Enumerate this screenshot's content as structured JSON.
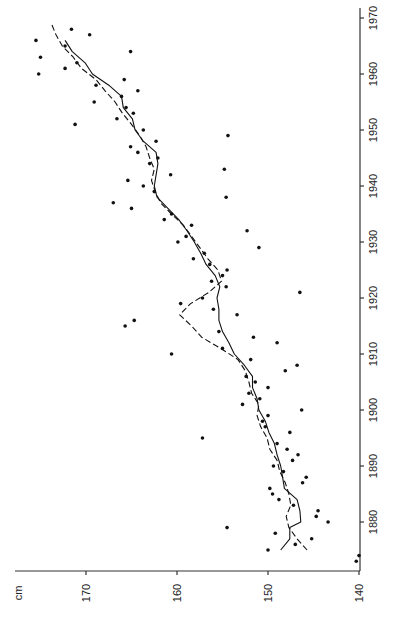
{
  "chart_data": {
    "type": "scatter",
    "title": "",
    "orientation": "rotated 90° (height axis horizontal at bottom, year axis vertical at right)",
    "xlabel": "Year",
    "ylabel": "cm",
    "height_axis": {
      "label": "cm",
      "ticks": [
        170,
        160,
        150,
        140
      ],
      "range": [
        140,
        176
      ]
    },
    "year_axis": {
      "ticks": [
        1880,
        1890,
        1900,
        1910,
        1920,
        1930,
        1940,
        1950,
        1960,
        1970
      ],
      "range": [
        1871,
        1970
      ]
    },
    "grid": false,
    "legend": null,
    "series": [
      {
        "name": "observations",
        "style": "points",
        "points": [
          [
            1873,
            140.3
          ],
          [
            1874,
            140.0
          ],
          [
            1875,
            150.0
          ],
          [
            1876,
            147.0
          ],
          [
            1877,
            145.2
          ],
          [
            1878,
            149.2
          ],
          [
            1879,
            154.5
          ],
          [
            1880,
            143.4
          ],
          [
            1881,
            144.7
          ],
          [
            1882,
            144.5
          ],
          [
            1883,
            147.2
          ],
          [
            1884,
            148.8
          ],
          [
            1885,
            149.5
          ],
          [
            1886,
            149.8
          ],
          [
            1887,
            146.2
          ],
          [
            1888,
            145.8
          ],
          [
            1889,
            148.3
          ],
          [
            1890,
            149.4
          ],
          [
            1891,
            147.3
          ],
          [
            1892,
            146.7
          ],
          [
            1893,
            147.9
          ],
          [
            1894,
            149.0
          ],
          [
            1895,
            157.2
          ],
          [
            1896,
            147.6
          ],
          [
            1897,
            150.3
          ],
          [
            1898,
            150.6
          ],
          [
            1899,
            150.0
          ],
          [
            1900,
            146.3
          ],
          [
            1901,
            152.8
          ],
          [
            1902,
            150.9
          ],
          [
            1903,
            152.1
          ],
          [
            1904,
            150.0
          ],
          [
            1905,
            151.4
          ],
          [
            1906,
            152.4
          ],
          [
            1907,
            148.1
          ],
          [
            1908,
            146.8
          ],
          [
            1909,
            151.9
          ],
          [
            1910,
            160.6
          ],
          [
            1911,
            155.0
          ],
          [
            1912,
            149.0
          ],
          [
            1913,
            151.6
          ],
          [
            1914,
            155.4
          ],
          [
            1915,
            165.7
          ],
          [
            1916,
            164.7
          ],
          [
            1917,
            153.4
          ],
          [
            1918,
            156.0
          ],
          [
            1919,
            159.6
          ],
          [
            1920,
            157.2
          ],
          [
            1921,
            146.5
          ],
          [
            1922,
            154.6
          ],
          [
            1923,
            156.2
          ],
          [
            1924,
            155.0
          ],
          [
            1925,
            154.5
          ],
          [
            1926,
            156.4
          ],
          [
            1927,
            158.2
          ],
          [
            1928,
            157.0
          ],
          [
            1929,
            151.0
          ],
          [
            1930,
            159.9
          ],
          [
            1931,
            159.0
          ],
          [
            1932,
            152.3
          ],
          [
            1933,
            158.4
          ],
          [
            1934,
            161.4
          ],
          [
            1935,
            160.6
          ],
          [
            1936,
            165.0
          ],
          [
            1937,
            167.0
          ],
          [
            1938,
            154.6
          ],
          [
            1939,
            162.5
          ],
          [
            1940,
            163.7
          ],
          [
            1941,
            165.4
          ],
          [
            1942,
            160.7
          ],
          [
            1943,
            154.8
          ],
          [
            1944,
            163.0
          ],
          [
            1945,
            162.1
          ],
          [
            1946,
            164.3
          ],
          [
            1947,
            165.1
          ],
          [
            1948,
            162.3
          ],
          [
            1949,
            154.4
          ],
          [
            1950,
            163.7
          ],
          [
            1951,
            171.2
          ],
          [
            1952,
            166.6
          ],
          [
            1953,
            164.8
          ],
          [
            1954,
            165.6
          ],
          [
            1955,
            169.1
          ],
          [
            1956,
            166.1
          ],
          [
            1957,
            164.3
          ],
          [
            1958,
            168.9
          ],
          [
            1959,
            165.8
          ],
          [
            1960,
            175.2
          ],
          [
            1961,
            172.3
          ],
          [
            1962,
            171.0
          ],
          [
            1963,
            175.0
          ],
          [
            1964,
            165.1
          ],
          [
            1965,
            172.3
          ],
          [
            1966,
            175.5
          ],
          [
            1967,
            169.6
          ],
          [
            1968,
            171.6
          ]
        ]
      },
      {
        "name": "moving average",
        "style": "solid line",
        "points": [
          [
            1875,
            148.6
          ],
          [
            1877,
            147.6
          ],
          [
            1879,
            147.6
          ],
          [
            1880,
            146.4
          ],
          [
            1882,
            146.5
          ],
          [
            1884,
            146.8
          ],
          [
            1886,
            148.2
          ],
          [
            1888,
            148.4
          ],
          [
            1890,
            148.6
          ],
          [
            1892,
            149.0
          ],
          [
            1894,
            149.3
          ],
          [
            1896,
            149.9
          ],
          [
            1898,
            150.3
          ],
          [
            1900,
            151.0
          ],
          [
            1902,
            151.2
          ],
          [
            1904,
            151.7
          ],
          [
            1906,
            151.7
          ],
          [
            1908,
            152.6
          ],
          [
            1910,
            153.7
          ],
          [
            1912,
            154.3
          ],
          [
            1914,
            155.0
          ],
          [
            1916,
            155.4
          ],
          [
            1918,
            155.4
          ],
          [
            1920,
            155.6
          ],
          [
            1922,
            155.3
          ],
          [
            1924,
            155.8
          ],
          [
            1926,
            156.8
          ],
          [
            1928,
            157.4
          ],
          [
            1930,
            158.1
          ],
          [
            1932,
            158.9
          ],
          [
            1934,
            159.8
          ],
          [
            1936,
            161.0
          ],
          [
            1938,
            162.2
          ],
          [
            1940,
            162.5
          ],
          [
            1942,
            162.3
          ],
          [
            1944,
            162.1
          ],
          [
            1946,
            162.3
          ],
          [
            1948,
            163.7
          ],
          [
            1950,
            164.6
          ],
          [
            1952,
            164.9
          ],
          [
            1954,
            165.9
          ],
          [
            1956,
            166.1
          ],
          [
            1958,
            167.5
          ],
          [
            1960,
            169.3
          ],
          [
            1962,
            170.1
          ],
          [
            1964,
            171.5
          ],
          [
            1966,
            172.3
          ]
        ]
      },
      {
        "name": "smoothed trend",
        "style": "dashed line",
        "points": [
          [
            1875,
            145.7
          ],
          [
            1877,
            146.8
          ],
          [
            1879,
            147.7
          ],
          [
            1881,
            148.0
          ],
          [
            1883,
            147.5
          ],
          [
            1885,
            147.7
          ],
          [
            1887,
            148.1
          ],
          [
            1889,
            148.7
          ],
          [
            1891,
            149.0
          ],
          [
            1893,
            149.8
          ],
          [
            1895,
            150.1
          ],
          [
            1897,
            150.8
          ],
          [
            1899,
            151.2
          ],
          [
            1901,
            151.0
          ],
          [
            1903,
            151.8
          ],
          [
            1905,
            152.1
          ],
          [
            1907,
            152.5
          ],
          [
            1909,
            153.3
          ],
          [
            1911,
            155.2
          ],
          [
            1913,
            157.3
          ],
          [
            1915,
            158.4
          ],
          [
            1917,
            159.7
          ],
          [
            1919,
            158.5
          ],
          [
            1921,
            156.5
          ],
          [
            1923,
            155.1
          ],
          [
            1925,
            155.5
          ],
          [
            1927,
            156.6
          ],
          [
            1929,
            157.5
          ],
          [
            1931,
            158.4
          ],
          [
            1933,
            159.3
          ],
          [
            1935,
            160.6
          ],
          [
            1937,
            161.8
          ],
          [
            1939,
            162.4
          ],
          [
            1941,
            162.8
          ],
          [
            1943,
            162.5
          ],
          [
            1945,
            163.0
          ],
          [
            1947,
            163.4
          ],
          [
            1949,
            164.1
          ],
          [
            1951,
            165.0
          ],
          [
            1953,
            166.0
          ],
          [
            1955,
            166.8
          ],
          [
            1957,
            167.9
          ],
          [
            1959,
            168.9
          ],
          [
            1961,
            170.5
          ],
          [
            1963,
            171.4
          ],
          [
            1965,
            172.6
          ],
          [
            1967,
            173.3
          ],
          [
            1969,
            173.8
          ]
        ]
      }
    ]
  }
}
